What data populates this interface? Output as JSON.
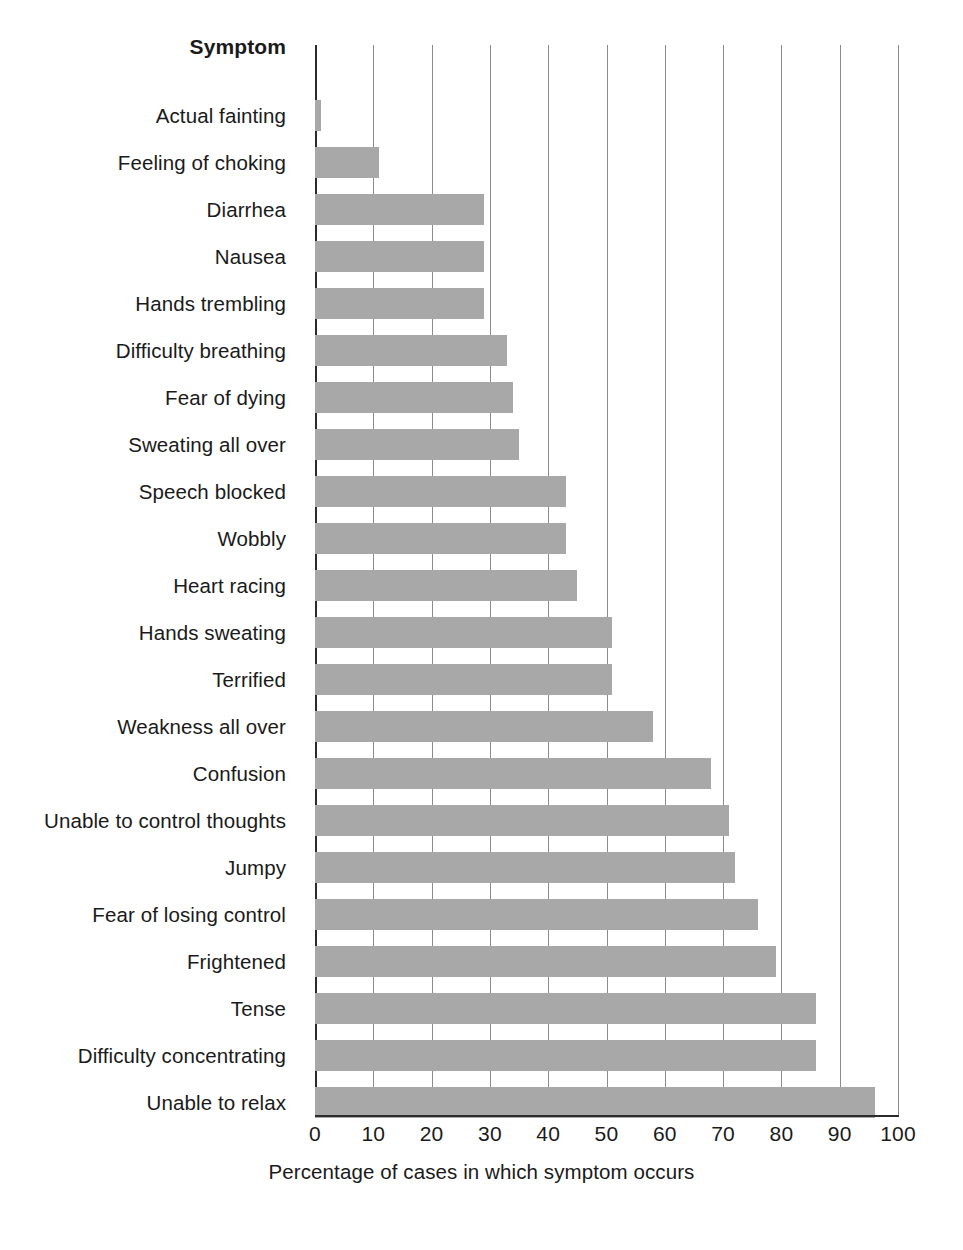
{
  "chart_data": {
    "type": "bar",
    "orientation": "horizontal",
    "title": "",
    "header_label": "Symptom",
    "xlabel": "Percentage of cases in which symptom occurs",
    "ylabel": "Symptom",
    "xlim": [
      0,
      100
    ],
    "xticks": [
      0,
      10,
      20,
      30,
      40,
      50,
      60,
      70,
      80,
      90,
      100
    ],
    "xtick_labels": [
      "0",
      "10",
      "20",
      "30",
      "40",
      "50",
      "60",
      "70",
      "80",
      "90",
      "100"
    ],
    "grid": "vertical",
    "legend": "none",
    "bar_color": "#a8a8a8",
    "axis_color": "#2b2b2b",
    "gridline_color": "#8b8b8b",
    "categories": [
      "Actual fainting",
      "Feeling of choking",
      "Diarrhea",
      "Nausea",
      "Hands trembling",
      "Difficulty breathing",
      "Fear of dying",
      "Sweating all over",
      "Speech blocked",
      "Wobbly",
      "Heart racing",
      "Hands sweating",
      "Terrified",
      "Weakness all over",
      "Confusion",
      "Unable to control thoughts",
      "Jumpy",
      "Fear of losing control",
      "Frightened",
      "Tense",
      "Difficulty concentrating",
      "Unable to relax"
    ],
    "values": [
      1,
      11,
      29,
      29,
      29,
      33,
      34,
      35,
      43,
      43,
      45,
      51,
      51,
      58,
      68,
      71,
      72,
      76,
      79,
      86,
      86,
      96
    ]
  }
}
